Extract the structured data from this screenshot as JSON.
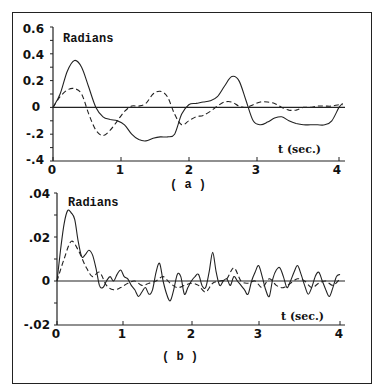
{
  "chart_data": [
    {
      "type": "line",
      "panel": "a",
      "caption": "( a )",
      "ylabel": "Radians",
      "xlabel": "t (sec.)",
      "xlim": [
        0,
        4
      ],
      "ylim": [
        -0.4,
        0.6
      ],
      "x_ticks": [
        "0",
        "1",
        "2",
        "3",
        "4"
      ],
      "y_ticks": [
        "0.6",
        "0.4",
        "0.2",
        "0",
        "-.2",
        "-.4"
      ],
      "grid": false,
      "series": [
        {
          "name": "solid",
          "style": "solid",
          "x": [
            0,
            0.1,
            0.2,
            0.3,
            0.4,
            0.5,
            0.6,
            0.7,
            0.8,
            0.9,
            1.0,
            1.1,
            1.2,
            1.3,
            1.4,
            1.5,
            1.6,
            1.7,
            1.8,
            1.9,
            2.0,
            2.1,
            2.2,
            2.3,
            2.4,
            2.5,
            2.6,
            2.7,
            2.8,
            2.9,
            3.0,
            3.1,
            3.2,
            3.3,
            3.4,
            3.5,
            3.6,
            3.7,
            3.8,
            3.9,
            4.0,
            4.05
          ],
          "values": [
            0,
            0.1,
            0.27,
            0.35,
            0.3,
            0.15,
            0.0,
            -0.07,
            -0.09,
            -0.1,
            -0.13,
            -0.2,
            -0.24,
            -0.25,
            -0.23,
            -0.22,
            -0.22,
            -0.2,
            -0.05,
            0.02,
            0.03,
            0.04,
            0.05,
            0.08,
            0.16,
            0.23,
            0.2,
            0.05,
            -0.1,
            -0.13,
            -0.11,
            -0.08,
            -0.07,
            -0.1,
            -0.12,
            -0.13,
            -0.13,
            -0.13,
            -0.13,
            -0.1,
            0.0,
            0.03
          ]
        },
        {
          "name": "dashed",
          "style": "dashed",
          "x": [
            0,
            0.1,
            0.2,
            0.3,
            0.4,
            0.5,
            0.6,
            0.7,
            0.8,
            0.9,
            1.0,
            1.1,
            1.2,
            1.3,
            1.4,
            1.5,
            1.6,
            1.7,
            1.8,
            1.9,
            2.0,
            2.1,
            2.2,
            2.3,
            2.4,
            2.5,
            2.6,
            2.7,
            2.8,
            2.9,
            3.0,
            3.1,
            3.2,
            3.3,
            3.4,
            3.5,
            3.6,
            3.7,
            3.8,
            3.9,
            4.0,
            4.05
          ],
          "values": [
            0,
            0.08,
            0.13,
            0.14,
            0.1,
            -0.05,
            -0.17,
            -0.21,
            -0.17,
            -0.1,
            -0.03,
            0.01,
            0.01,
            0.03,
            0.1,
            0.12,
            0.08,
            -0.05,
            -0.13,
            -0.1,
            -0.07,
            -0.06,
            -0.03,
            0.01,
            0.04,
            0.04,
            0.01,
            0.0,
            0.02,
            0.04,
            0.04,
            0.03,
            0.0,
            -0.02,
            -0.02,
            0.0,
            0.0,
            0.01,
            0.01,
            0.01,
            0.02,
            0.02
          ]
        }
      ]
    },
    {
      "type": "line",
      "panel": "b",
      "caption": "( b )",
      "ylabel": "Radians",
      "xlabel": "t (sec.)",
      "xlim": [
        0,
        4
      ],
      "ylim": [
        -0.02,
        0.04
      ],
      "x_ticks": [
        "0",
        "1",
        "2",
        "3",
        "4"
      ],
      "y_ticks": [
        ".04",
        ".02",
        "0",
        "-.02"
      ],
      "grid": false,
      "series": [
        {
          "name": "solid",
          "style": "solid",
          "x": [
            0,
            0.05,
            0.1,
            0.15,
            0.2,
            0.25,
            0.3,
            0.35,
            0.4,
            0.45,
            0.5,
            0.55,
            0.6,
            0.65,
            0.7,
            0.75,
            0.8,
            0.85,
            0.9,
            0.95,
            1.0,
            1.05,
            1.1,
            1.15,
            1.2,
            1.25,
            1.3,
            1.35,
            1.4,
            1.45,
            1.5,
            1.55,
            1.6,
            1.65,
            1.7,
            1.75,
            1.8,
            1.85,
            1.9,
            1.95,
            2.0,
            2.05,
            2.1,
            2.15,
            2.2,
            2.25,
            2.3,
            2.35,
            2.4,
            2.45,
            2.5,
            2.55,
            2.6,
            2.65,
            2.7,
            2.75,
            2.8,
            2.85,
            2.9,
            2.95,
            3.0,
            3.05,
            3.1,
            3.15,
            3.2,
            3.25,
            3.3,
            3.35,
            3.4,
            3.45,
            3.5,
            3.55,
            3.6,
            3.65,
            3.7,
            3.75,
            3.8,
            3.85,
            3.9,
            3.95,
            4.0
          ],
          "values": [
            0,
            0.014,
            0.026,
            0.032,
            0.031,
            0.028,
            0.018,
            0.011,
            0.012,
            0.014,
            0.012,
            0.006,
            -0.002,
            -0.003,
            0.0,
            0.002,
            0.0,
            0.003,
            0.005,
            0.002,
            0.001,
            -0.002,
            -0.004,
            -0.007,
            -0.005,
            -0.003,
            -0.006,
            -0.004,
            0.004,
            0.008,
            0.0,
            -0.006,
            -0.009,
            -0.004,
            0.003,
            0.002,
            -0.006,
            -0.003,
            0.0,
            0.002,
            0.003,
            -0.002,
            -0.003,
            0.004,
            0.013,
            0.004,
            -0.002,
            0.0,
            0.001,
            -0.002,
            0.002,
            0.0,
            -0.002,
            -0.004,
            -0.006,
            0.0,
            0.004,
            0.007,
            0.002,
            -0.004,
            -0.007,
            0.001,
            0.005,
            0.006,
            0.002,
            -0.003,
            0.0,
            0.004,
            0.007,
            0.003,
            -0.002,
            -0.006,
            -0.003,
            0.002,
            0.004,
            0.0,
            -0.004,
            -0.007,
            -0.003,
            0.002,
            0.003
          ]
        },
        {
          "name": "dashed",
          "style": "dashed",
          "x": [
            0,
            0.1,
            0.2,
            0.3,
            0.4,
            0.5,
            0.6,
            0.7,
            0.8,
            0.9,
            1.0,
            1.1,
            1.2,
            1.3,
            1.4,
            1.5,
            1.6,
            1.7,
            1.8,
            1.9,
            2.0,
            2.1,
            2.2,
            2.3,
            2.4,
            2.5,
            2.6,
            2.7,
            2.8,
            2.9,
            3.0,
            3.1,
            3.2,
            3.3,
            3.4,
            3.5,
            3.6,
            3.7,
            3.8,
            3.9,
            4.0
          ],
          "values": [
            0,
            0.01,
            0.018,
            0.014,
            0.007,
            0.002,
            0.004,
            -0.002,
            -0.004,
            -0.003,
            -0.001,
            0.0,
            -0.002,
            -0.001,
            0.0,
            0.002,
            -0.001,
            -0.003,
            -0.002,
            -0.001,
            -0.002,
            -0.005,
            -0.001,
            0.0,
            0.001,
            0.006,
            0.0,
            -0.001,
            0.0,
            -0.003,
            0.001,
            -0.002,
            -0.003,
            -0.001,
            0.001,
            0.0,
            -0.003,
            -0.001,
            0.0,
            -0.002,
            0.001
          ]
        }
      ]
    }
  ],
  "panels": {
    "a": {
      "ylabel": "Radians",
      "xlabel": "t (sec.)",
      "caption": "( a )",
      "x_ticks": [
        "0",
        "1",
        "2",
        "3",
        "4"
      ],
      "y_ticks": [
        "0.6",
        "0.4",
        "0.2",
        "0",
        "-.2",
        "-.4"
      ]
    },
    "b": {
      "ylabel": "Radians",
      "xlabel": "t (sec.)",
      "caption": "( b )",
      "x_ticks": [
        "0",
        "1",
        "2",
        "3",
        "4"
      ],
      "y_ticks": [
        ".04",
        ".02",
        "0",
        "-.02"
      ]
    }
  },
  "colors": {
    "line": "#222222",
    "frame": "#222222",
    "background": "#ffffff"
  }
}
